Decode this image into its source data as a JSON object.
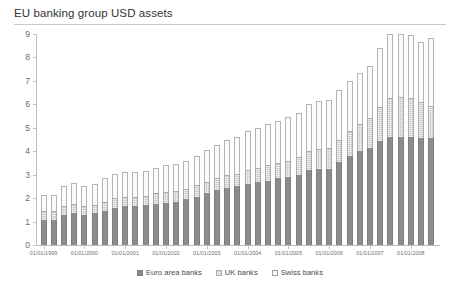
{
  "chart_data": {
    "type": "bar",
    "title": "EU banking group USD assets",
    "xlabel": "",
    "ylabel": "",
    "ylim": [
      0,
      9
    ],
    "yticks": [
      0,
      1,
      2,
      3,
      4,
      5,
      6,
      7,
      8,
      9
    ],
    "grid": false,
    "stacked": true,
    "legend_position": "bottom",
    "legend": [
      "Euro area banks",
      "UK banks",
      "Swiss banks"
    ],
    "colors": {
      "euro_area_banks": "#8c8c8c",
      "uk_banks": "#c4c4c4",
      "swiss_banks": "#fbfbfb",
      "axis": "#bdbdbd",
      "text": "#4a4a4a",
      "title": "#333333"
    },
    "categories": [
      "01/01/1999",
      "01/04/1999",
      "01/07/1999",
      "01/10/1999",
      "01/01/2000",
      "01/04/2000",
      "01/07/2000",
      "01/10/2000",
      "01/01/2001",
      "01/04/2001",
      "01/07/2001",
      "01/10/2001",
      "01/01/2002",
      "01/04/2002",
      "01/07/2002",
      "01/10/2002",
      "01/01/2003",
      "01/04/2003",
      "01/07/2003",
      "01/10/2003",
      "01/01/2004",
      "01/04/2004",
      "01/07/2004",
      "01/10/2004",
      "01/01/2005",
      "01/04/2005",
      "01/07/2005",
      "01/10/2005",
      "01/01/2006",
      "01/04/2006",
      "01/07/2006",
      "01/10/2006",
      "01/01/2007",
      "01/04/2007",
      "01/07/2007",
      "01/10/2007",
      "01/01/2008",
      "01/04/2008",
      "01/07/2008"
    ],
    "xtick_labels": [
      "01/01/1999",
      "01/01/2000",
      "01/01/2001",
      "01/01/2002",
      "01/01/2003",
      "01/01/2004",
      "01/01/2005",
      "01/01/2006",
      "01/01/2007",
      "01/01/2008"
    ],
    "series": [
      {
        "name": "Euro area banks",
        "values": [
          1.05,
          1.05,
          1.3,
          1.35,
          1.3,
          1.35,
          1.45,
          1.6,
          1.65,
          1.65,
          1.7,
          1.75,
          1.8,
          1.85,
          1.95,
          2.05,
          2.2,
          2.35,
          2.45,
          2.5,
          2.6,
          2.7,
          2.75,
          2.85,
          2.9,
          3.0,
          3.2,
          3.25,
          3.25,
          3.55,
          3.8,
          4.0,
          4.15,
          4.45,
          4.6,
          4.6,
          4.6,
          4.55,
          4.55
        ]
      },
      {
        "name": "UK banks",
        "values": [
          0.4,
          0.4,
          0.35,
          0.4,
          0.35,
          0.35,
          0.4,
          0.4,
          0.4,
          0.4,
          0.4,
          0.45,
          0.45,
          0.45,
          0.45,
          0.5,
          0.5,
          0.5,
          0.55,
          0.55,
          0.6,
          0.6,
          0.65,
          0.65,
          0.7,
          0.75,
          0.8,
          0.85,
          0.9,
          0.95,
          1.05,
          1.15,
          1.25,
          1.45,
          1.65,
          1.7,
          1.65,
          1.55,
          1.4
        ]
      },
      {
        "name": "Swiss banks",
        "values": [
          0.7,
          0.7,
          0.85,
          0.9,
          0.85,
          0.9,
          1.0,
          1.05,
          1.05,
          1.05,
          1.05,
          1.1,
          1.15,
          1.15,
          1.2,
          1.25,
          1.35,
          1.4,
          1.5,
          1.55,
          1.65,
          1.7,
          1.75,
          1.8,
          1.85,
          1.9,
          2.0,
          2.05,
          2.05,
          2.1,
          2.15,
          2.2,
          2.25,
          2.5,
          2.75,
          2.7,
          2.7,
          2.55,
          2.9
        ]
      }
    ],
    "totals": [
      2.15,
      2.15,
      2.5,
      2.65,
      2.5,
      2.6,
      2.85,
      3.05,
      3.1,
      3.1,
      3.15,
      3.3,
      3.4,
      3.45,
      3.6,
      3.8,
      4.05,
      4.25,
      4.5,
      4.6,
      4.85,
      5.0,
      5.15,
      5.3,
      5.45,
      5.65,
      6.0,
      6.15,
      6.2,
      6.6,
      7.0,
      7.35,
      7.65,
      8.4,
      9.0,
      9.0,
      8.95,
      8.65,
      8.85
    ]
  }
}
